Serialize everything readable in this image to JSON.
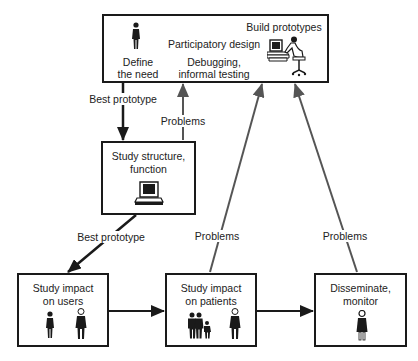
{
  "diagram": {
    "nodes": {
      "top": {
        "define_need_l1": "Define",
        "define_need_l2": "the need",
        "build_prototypes": "Build prototypes",
        "participatory_design": "Participatory design",
        "debugging_l1": "Debugging,",
        "debugging_l2": "informal testing"
      },
      "structure": {
        "l1": "Study structure,",
        "l2": "function"
      },
      "users": {
        "l1": "Study impact",
        "l2": "on users"
      },
      "patients": {
        "l1": "Study impact",
        "l2": "on patients"
      },
      "disseminate": {
        "l1": "Disseminate,",
        "l2": "monitor"
      }
    },
    "edges": {
      "best_prototype_1": "Best prototype",
      "problems_1": "Problems",
      "best_prototype_2": "Best prototype",
      "problems_2": "Problems",
      "problems_3": "Problems"
    },
    "colors": {
      "line": "#1a1a1a",
      "feedback_line": "#555555"
    }
  }
}
